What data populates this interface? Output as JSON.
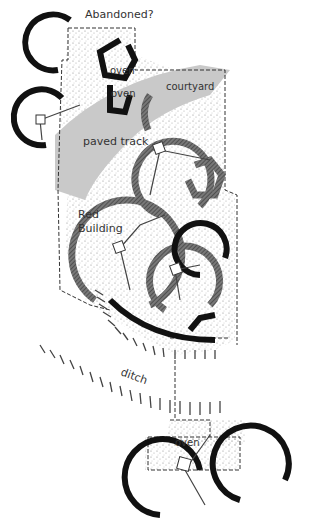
{
  "diagram": {
    "type": "archaeological site plan",
    "labels": {
      "abandoned": "Abandoned?",
      "oven_1": "oven",
      "oven_2": "oven",
      "courtyard": "courtyard",
      "paved_track": "paved track",
      "red_building_line1": "Red",
      "red_building_line2": "Building",
      "ditch": "ditch",
      "oven_3": "oven"
    },
    "colors": {
      "ink": "#111111",
      "hatched_wall": "#555555",
      "paved_track_fill": "#c9c9c9",
      "stipple": "#9a9a9a",
      "background": "#ffffff"
    }
  }
}
